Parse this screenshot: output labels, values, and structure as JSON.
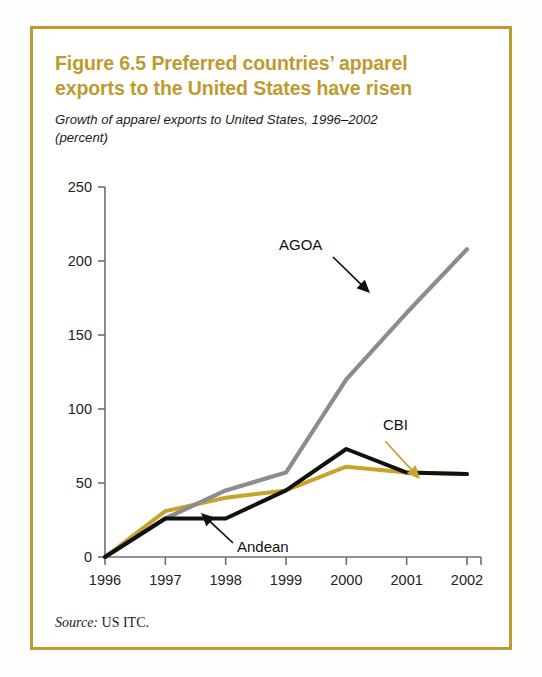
{
  "figure": {
    "title_line1": "Figure 6.5  Preferred countries’ apparel",
    "title_line2": "exports to the United States have risen",
    "subtitle_line1": "Growth of apparel exports to United States, 1996–2002",
    "subtitle_line2": "(percent)",
    "source_prefix": "Source:",
    "source_text": " US ITC.",
    "border_color": "#BE9A2F",
    "title_color": "#BE9A2F"
  },
  "chart_data": {
    "type": "line",
    "title": "Figure 6.5  Preferred countries’ apparel exports to the United States have risen",
    "subtitle": "Growth of apparel exports to United States, 1996–2002 (percent)",
    "xlabel": "",
    "ylabel": "",
    "x": [
      "1996",
      "1997",
      "1998",
      "1999",
      "2000",
      "2001",
      "2002"
    ],
    "xtick_labels": [
      "1996",
      "1997",
      "1998",
      "1999",
      "2000",
      "2001",
      "2002"
    ],
    "ytick_labels": [
      "0",
      "50",
      "100",
      "150",
      "200",
      "250"
    ],
    "yticks": [
      0,
      50,
      100,
      150,
      200,
      250
    ],
    "ylim": [
      0,
      250
    ],
    "grid": false,
    "legend": "inline-annotations",
    "series": [
      {
        "name": "AGOA",
        "color": "#8C8C8C",
        "values": [
          0,
          26,
          45,
          57,
          120,
          165,
          208
        ]
      },
      {
        "name": "CBI",
        "color": "#C9A22B",
        "values": [
          0,
          31,
          40,
          45,
          61,
          57,
          56
        ]
      },
      {
        "name": "Andean",
        "color": "#111111",
        "values": [
          0,
          26,
          26,
          45,
          73,
          57,
          56
        ]
      }
    ],
    "annotations": [
      {
        "label": "AGOA",
        "arrow_color": "#111111",
        "points_to_series": "AGOA"
      },
      {
        "label": "CBI",
        "arrow_color": "#C9A22B",
        "points_to_series": "CBI"
      },
      {
        "label": "Andean",
        "arrow_color": "#111111",
        "points_to_series": "Andean"
      }
    ]
  }
}
